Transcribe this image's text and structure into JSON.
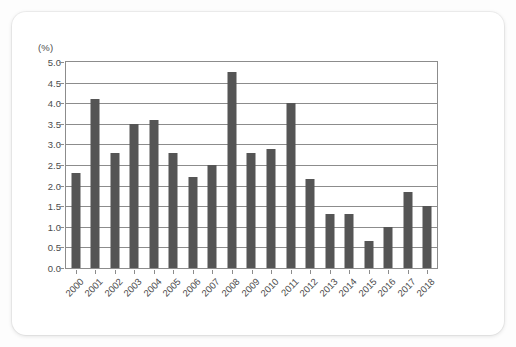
{
  "chart_data": {
    "type": "bar",
    "title": "",
    "subtitle": "",
    "xlabel": "",
    "ylabel": "(%)",
    "unit_label": "(%)",
    "ylim": [
      0.0,
      5.0
    ],
    "ytick_step": 0.5,
    "grid": true,
    "legend": "none",
    "bar_color": "#555555",
    "axis_color": "#8c8c8c",
    "text_color": "#4c4c4c",
    "ytick_labels": [
      "5.0",
      "4.5",
      "4.0",
      "3.5",
      "3.0",
      "2.5",
      "2.0",
      "1.5",
      "1.0",
      "0.5",
      "0.0"
    ],
    "ytick_values": [
      5.0,
      4.5,
      4.0,
      3.5,
      3.0,
      2.5,
      2.0,
      1.5,
      1.0,
      0.5,
      0.0
    ],
    "categories": [
      "2000",
      "2001",
      "2002",
      "2003",
      "2004",
      "2005",
      "2006",
      "2007",
      "2008",
      "2009",
      "2010",
      "2011",
      "2012",
      "2013",
      "2014",
      "2015",
      "2016",
      "2017",
      "2018"
    ],
    "values": [
      2.3,
      4.1,
      2.8,
      3.5,
      3.6,
      2.8,
      2.2,
      2.5,
      4.75,
      2.8,
      2.9,
      4.0,
      2.15,
      1.3,
      1.3,
      0.65,
      1.0,
      1.85,
      1.5
    ]
  }
}
